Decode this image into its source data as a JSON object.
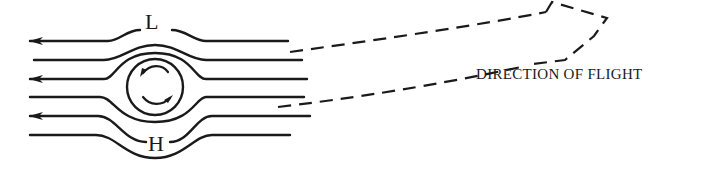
{
  "diagram": {
    "labels": {
      "low_pressure": "L",
      "high_pressure": "H",
      "direction": "DIRECTION OF FLIGHT"
    },
    "colors": {
      "ink": "#1a1a1a",
      "background": "#ffffff"
    },
    "streamlines": [
      {
        "id": "line-1",
        "y": 41,
        "arrow": true
      },
      {
        "id": "line-2",
        "y": 60,
        "arrow": false
      },
      {
        "id": "line-3",
        "y": 79,
        "arrow": true
      },
      {
        "id": "line-4",
        "y": 97,
        "arrow": false
      },
      {
        "id": "line-5",
        "y": 116,
        "arrow": true
      },
      {
        "id": "line-6",
        "y": 135,
        "arrow": false
      }
    ],
    "rotation": "clockwise"
  }
}
